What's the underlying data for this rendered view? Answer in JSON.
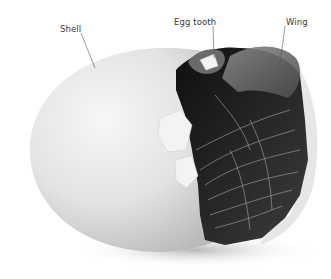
{
  "figure": {
    "labels": [
      {
        "id": "shell",
        "text": "Shell",
        "x": 60,
        "y": 24
      },
      {
        "id": "egg-tooth",
        "text": "Egg tooth",
        "x": 174,
        "y": 17
      },
      {
        "id": "wing",
        "text": "Wing",
        "x": 286,
        "y": 17
      }
    ],
    "colors": {
      "background": "#ffffff",
      "shell_light": "#f2f2f2",
      "shell_mid": "#d9d9d9",
      "shell_shadow": "#b5b5b5",
      "interior_dark": "#1e1e1e",
      "feather_mid": "#6b6b6b",
      "feather_light": "#a8a8a8",
      "leader_line": "#555555",
      "label_text": "#3a3a3a"
    }
  }
}
